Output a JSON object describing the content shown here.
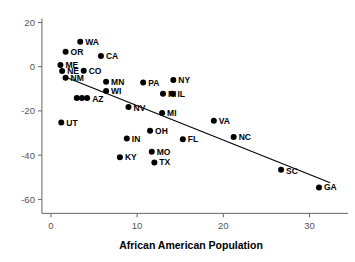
{
  "chart_data": {
    "type": "scatter",
    "title": "",
    "xlabel": "African American Population",
    "ylabel": "",
    "xlim": [
      -1.5,
      34
    ],
    "ylim": [
      -63,
      22
    ],
    "xticks": [
      0,
      10,
      20,
      30
    ],
    "xtick_labels": [
      "0",
      "10",
      "20",
      "30"
    ],
    "yticks": [
      20,
      0,
      -20,
      -40,
      -60
    ],
    "ytick_labels": [
      "20",
      "0",
      "-20",
      "-40",
      "-60"
    ],
    "grid": false,
    "legend": "none",
    "marker_color": "#000000",
    "fit_line_color": "#000000",
    "axis_color": "#666666",
    "fit_line": {
      "x_start": 1.6,
      "y_start": -4.6,
      "x_end": 32.4,
      "y_end": -52.5
    },
    "points": [
      {
        "label": "WA",
        "x": 3.4,
        "y": 11.3,
        "label_dx": 5,
        "label_dy": 3
      },
      {
        "label": "OR",
        "x": 1.7,
        "y": 6.7,
        "label_dx": 5,
        "label_dy": 3
      },
      {
        "label": "CA",
        "x": 5.8,
        "y": 4.8,
        "label_dx": 5,
        "label_dy": 3
      },
      {
        "label": "ME",
        "x": 1.1,
        "y": 0.8,
        "label_dx": 5,
        "label_dy": 3
      },
      {
        "label": "NE",
        "x": 1.3,
        "y": -2.0,
        "label_dx": 5,
        "label_dy": 3
      },
      {
        "label": "CO",
        "x": 3.8,
        "y": -1.8,
        "label_dx": 5,
        "label_dy": 3
      },
      {
        "label": "NM",
        "x": 1.7,
        "y": -5.0,
        "label_dx": 5,
        "label_dy": 3
      },
      {
        "label": "MN",
        "x": 6.4,
        "y": -6.8,
        "label_dx": 5,
        "label_dy": 3
      },
      {
        "label": "PA",
        "x": 10.7,
        "y": -7.2,
        "label_dx": 5,
        "label_dy": 3
      },
      {
        "label": "NY",
        "x": 14.2,
        "y": -6.0,
        "label_dx": 5,
        "label_dy": 3
      },
      {
        "label": "WI",
        "x": 6.4,
        "y": -11.0,
        "label_dx": 5,
        "label_dy": 3
      },
      {
        "label": "RI",
        "x": 13.0,
        "y": -12.2,
        "label_dx": 5,
        "label_dy": 3
      },
      {
        "label": "IL",
        "x": 14.1,
        "y": -12.2,
        "label_dx": 5,
        "label_dy": 3
      },
      {
        "label": "AZ",
        "x": 4.2,
        "y": -14.2,
        "label_dx": 5,
        "label_dy": 4
      },
      {
        "label": "",
        "x": 3.6,
        "y": -14.2,
        "label_dx": 0,
        "label_dy": 0
      },
      {
        "label": "",
        "x": 3.0,
        "y": -14.2,
        "label_dx": 0,
        "label_dy": 0
      },
      {
        "label": "NV",
        "x": 9.0,
        "y": -18.2,
        "label_dx": 5,
        "label_dy": 4
      },
      {
        "label": "MI",
        "x": 12.9,
        "y": -21.0,
        "label_dx": 5,
        "label_dy": 3
      },
      {
        "label": "VA",
        "x": 18.9,
        "y": -24.5,
        "label_dx": 5,
        "label_dy": 3
      },
      {
        "label": "UT",
        "x": 1.2,
        "y": -25.3,
        "label_dx": 5,
        "label_dy": 3
      },
      {
        "label": "OH",
        "x": 11.5,
        "y": -29.0,
        "label_dx": 5,
        "label_dy": 3
      },
      {
        "label": "IN",
        "x": 8.8,
        "y": -32.5,
        "label_dx": 5,
        "label_dy": 3
      },
      {
        "label": "FL",
        "x": 15.3,
        "y": -32.8,
        "label_dx": 5,
        "label_dy": 3
      },
      {
        "label": "NC",
        "x": 21.2,
        "y": -31.8,
        "label_dx": 5,
        "label_dy": 3
      },
      {
        "label": "MO",
        "x": 11.7,
        "y": -38.5,
        "label_dx": 5,
        "label_dy": 3
      },
      {
        "label": "KY",
        "x": 8.0,
        "y": -41.0,
        "label_dx": 5,
        "label_dy": 3
      },
      {
        "label": "TX",
        "x": 12.0,
        "y": -43.3,
        "label_dx": 5,
        "label_dy": 3
      },
      {
        "label": "SC",
        "x": 26.7,
        "y": -46.6,
        "label_dx": 5,
        "label_dy": 4
      },
      {
        "label": "GA",
        "x": 31.1,
        "y": -54.6,
        "label_dx": 5,
        "label_dy": 3
      }
    ]
  }
}
